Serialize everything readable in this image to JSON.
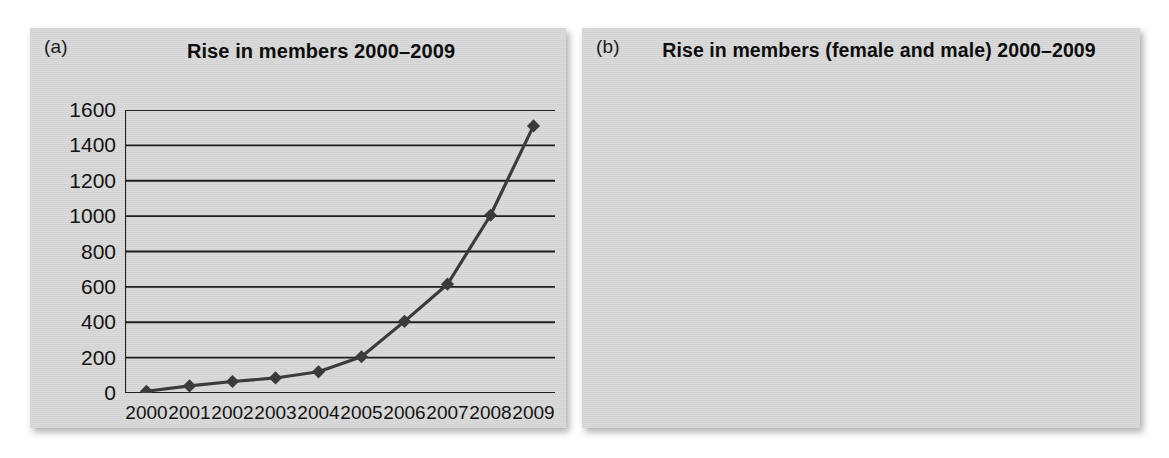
{
  "figure": {
    "background": "#ffffff",
    "panel_background": "#d6d6d6"
  },
  "panels": [
    {
      "tag": "(a)"
    },
    {
      "tag": "(b)"
    }
  ],
  "chart_data": [
    {
      "type": "line",
      "panel": "(a)",
      "title": "Rise in members 2000–2009",
      "xlabel": "",
      "ylabel": "",
      "x": [
        "2000",
        "2001",
        "2002",
        "2003",
        "2004",
        "2005",
        "2006",
        "2007",
        "2008",
        "2009"
      ],
      "categories": [
        "2000",
        "2001",
        "2002",
        "2003",
        "2004",
        "2005",
        "2006",
        "2007",
        "2008",
        "2009"
      ],
      "values": [
        10,
        40,
        65,
        85,
        120,
        205,
        405,
        615,
        1005,
        1510
      ],
      "series": [
        {
          "name": "Members",
          "color": "#3b3b3b",
          "marker": "diamond",
          "values": [
            10,
            40,
            65,
            85,
            120,
            205,
            405,
            615,
            1005,
            1510
          ]
        }
      ],
      "yticks": [
        0,
        200,
        400,
        600,
        800,
        1000,
        1200,
        1400,
        1600
      ],
      "ytick_labels": [
        "0",
        "200",
        "400",
        "600",
        "800",
        "1000",
        "1200",
        "1400",
        "1600"
      ],
      "ylim": [
        0,
        1600
      ],
      "grid": true,
      "legend": false,
      "legend_position": "none"
    },
    {
      "type": "line",
      "panel": "(b)",
      "title": "Rise in members (female and male) 2000–2009",
      "xlabel": "",
      "ylabel": "",
      "x": [
        "2000",
        "2001",
        "2002",
        "2003",
        "2004",
        "2005",
        "2006",
        "2007",
        "2008",
        "2009"
      ],
      "categories": [
        "2000",
        "2001",
        "2002",
        "2003",
        "2004",
        "2005",
        "2006",
        "2007",
        "2008",
        "2009"
      ],
      "series": [
        {
          "name": "Male",
          "color": "#3b3b3b",
          "marker": "diamond",
          "values": [
            10,
            40,
            65,
            85,
            120,
            205,
            405,
            615,
            1010,
            1510
          ]
        },
        {
          "name": "Female",
          "color": "#8c8c8c",
          "marker": "square",
          "values": [
            20,
            45,
            75,
            105,
            210,
            410,
            610,
            1015,
            1515,
            2020
          ]
        }
      ],
      "yticks": [
        0,
        500,
        1000,
        1500,
        2000,
        2500
      ],
      "ytick_labels": [
        "0",
        "500",
        "1000",
        "1500",
        "2000",
        "2500"
      ],
      "ylim": [
        0,
        2500
      ],
      "grid": true,
      "legend": true,
      "legend_position": "top-right",
      "legend_entries": [
        "Male",
        "Female"
      ]
    }
  ]
}
